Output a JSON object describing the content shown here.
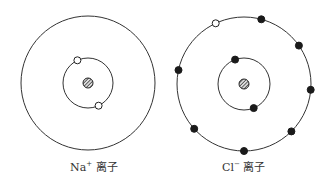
{
  "ions": [
    {
      "id": "na",
      "symbol": "Na",
      "charge": "+",
      "label_suffix": " 离子",
      "shells": [
        {
          "electrons": [
            {
              "type": "hollow"
            },
            {
              "type": "hollow"
            }
          ]
        },
        {
          "electrons": []
        }
      ]
    },
    {
      "id": "cl",
      "symbol": "Cl",
      "charge": "−",
      "label_suffix": " 离子",
      "shells": [
        {
          "electrons": [
            {
              "type": "filled"
            },
            {
              "type": "filled"
            }
          ]
        },
        {
          "electrons": [
            {
              "type": "hollow"
            },
            {
              "type": "filled"
            },
            {
              "type": "filled"
            },
            {
              "type": "filled"
            },
            {
              "type": "filled"
            },
            {
              "type": "filled"
            },
            {
              "type": "filled"
            },
            {
              "type": "filled"
            }
          ]
        }
      ]
    }
  ],
  "colors": {
    "line": "#333333",
    "electron": "#1a1a1a",
    "background": "#ffffff"
  }
}
